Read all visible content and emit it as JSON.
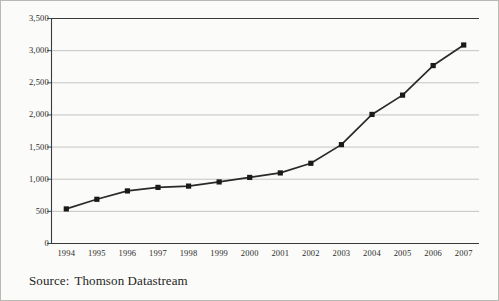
{
  "page": {
    "background_color": "#fbfbf9",
    "border_color": "#b8b8b4"
  },
  "caption": {
    "label": "Source:",
    "value": "Thomson Datastream"
  },
  "style": {
    "line_color": "#2a2a2a",
    "marker_color": "#1a1a1a",
    "grid_color": "#b6b6b6",
    "axis_color": "#3a3a3a",
    "text_color": "#2b2b2b"
  },
  "chart_data": {
    "type": "line",
    "title": "",
    "subtitle": "",
    "xlabel": "",
    "ylabel": "",
    "categories": [
      "1994",
      "1995",
      "1996",
      "1997",
      "1998",
      "1999",
      "2000",
      "2001",
      "2002",
      "2003",
      "2004",
      "2005",
      "2006",
      "2007"
    ],
    "values": [
      530,
      680,
      810,
      865,
      885,
      950,
      1020,
      1090,
      1240,
      1530,
      2000,
      2300,
      2760,
      3080
    ],
    "ylim": [
      0,
      3500
    ],
    "ytick_values": [
      0,
      500,
      1000,
      1500,
      2000,
      2500,
      3000,
      3500
    ],
    "ytick_labels": [
      "0",
      "500",
      "1,000",
      "1,500",
      "2,000",
      "2,500",
      "3,000",
      "3,500"
    ],
    "grid": "horizontal",
    "legend": "none",
    "marker": "square",
    "annotations": []
  }
}
